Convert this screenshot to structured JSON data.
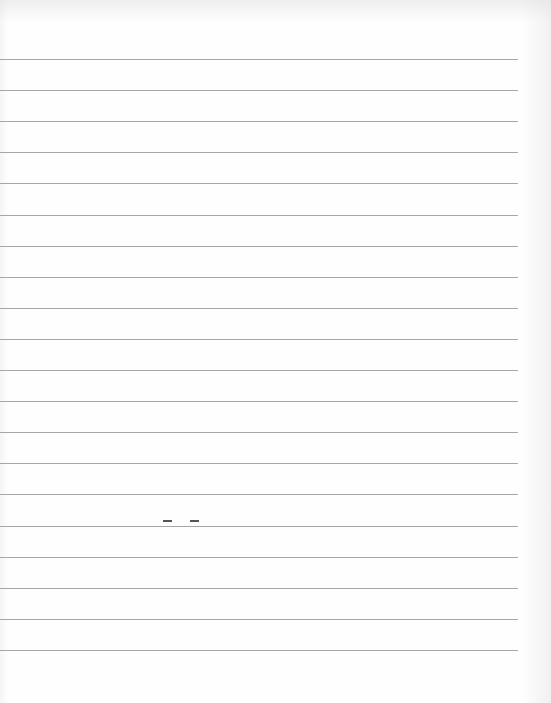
{
  "page": {
    "type": "lined-paper",
    "background_color": "#fefefe",
    "rule_color": "#a6a6a6",
    "rule_count": 20,
    "first_rule_y": 59,
    "rule_spacing": 31.1,
    "rule_left": 0,
    "rule_right": 518
  },
  "marks": [
    {
      "x": 163,
      "y": 520,
      "width": 9
    },
    {
      "x": 190,
      "y": 520,
      "width": 9
    }
  ]
}
